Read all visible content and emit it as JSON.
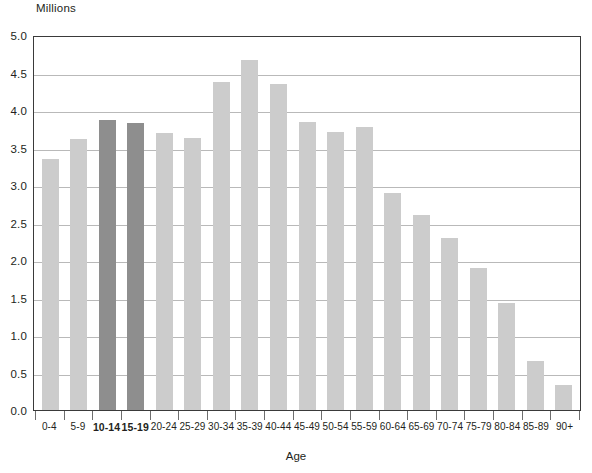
{
  "chart_data": {
    "type": "bar",
    "title": "",
    "subtitle": "",
    "unit_caption": "Millions",
    "xlabel": "Age",
    "ylabel": "",
    "ylim": [
      0.0,
      5.0
    ],
    "ytick_step": 0.5,
    "grid": true,
    "legend": "none",
    "categories": [
      "0-4",
      "5-9",
      "10-14",
      "15-19",
      "20-24",
      "25-29",
      "30-34",
      "35-39",
      "40-44",
      "45-49",
      "50-54",
      "55-59",
      "60-64",
      "65-69",
      "70-74",
      "75-79",
      "80-84",
      "85-89",
      "90+"
    ],
    "values": [
      3.35,
      3.62,
      3.87,
      3.83,
      3.69,
      3.63,
      4.37,
      4.67,
      4.35,
      3.84,
      3.71,
      3.78,
      2.9,
      2.6,
      2.29,
      1.9,
      1.43,
      0.65,
      0.34
    ],
    "highlighted_categories": [
      "10-14",
      "15-19"
    ],
    "ytick_labels": [
      "5.0",
      "4.5",
      "4.0",
      "3.5",
      "3.0",
      "2.5",
      "2.0",
      "1.5",
      "1.0",
      "0.5",
      "0.0"
    ],
    "colors": {
      "bar": "#cccccc",
      "bar_highlight": "#8e8e8e",
      "gridline": "#b9b9b9",
      "axis": "#3a3a3a",
      "text": "#231f20",
      "background": "#ffffff"
    }
  }
}
